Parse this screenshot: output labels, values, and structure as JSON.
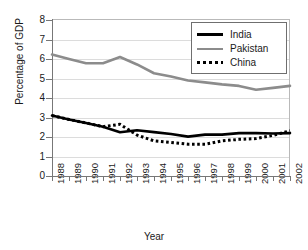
{
  "chart_data": {
    "type": "line",
    "title": "",
    "xlabel": "Year",
    "ylabel": "Percentage of GDP",
    "x": [
      1988,
      1989,
      1990,
      1991,
      1992,
      1993,
      1994,
      1995,
      1996,
      1997,
      1998,
      1999,
      2000,
      2001,
      2002
    ],
    "categories": [
      "1988",
      "1989",
      "1990",
      "1991",
      "1992",
      "1993",
      "1994",
      "1995",
      "1996",
      "1997",
      "1998",
      "1999",
      "2000",
      "2001",
      "2002"
    ],
    "xlim": [
      1988,
      2002
    ],
    "ylim": [
      0,
      8
    ],
    "yticks": [
      0,
      1,
      2,
      3,
      4,
      5,
      6,
      7,
      8
    ],
    "grid": true,
    "legend_position": "top-right",
    "series": [
      {
        "name": "India",
        "style": "solid",
        "color": "#000000",
        "width": 2.6,
        "values": [
          3.1,
          2.9,
          2.72,
          2.53,
          2.24,
          2.35,
          2.25,
          2.15,
          2.02,
          2.12,
          2.12,
          2.2,
          2.2,
          2.18,
          2.2
        ]
      },
      {
        "name": "Pakistan",
        "style": "solid",
        "color": "#8c8c8c",
        "width": 2.6,
        "values": [
          6.23,
          6.0,
          5.78,
          5.78,
          6.1,
          5.72,
          5.27,
          5.1,
          4.9,
          4.8,
          4.7,
          4.62,
          4.42,
          4.52,
          4.62
        ]
      },
      {
        "name": "China",
        "style": "dotted",
        "color": "#000000",
        "width": 3.0,
        "values": [
          3.1,
          2.9,
          2.72,
          2.53,
          2.65,
          2.1,
          1.8,
          1.72,
          1.63,
          1.63,
          1.8,
          1.88,
          1.92,
          2.08,
          2.32
        ]
      }
    ]
  },
  "axes": {
    "ylabel": "Percentage of GDP",
    "xlabel": "Year",
    "ytick_labels": [
      "8",
      "7",
      "6",
      "5",
      "4",
      "3",
      "2",
      "1",
      "0"
    ],
    "xtick_labels": [
      "1988",
      "1989",
      "1990",
      "1991",
      "1992",
      "1993",
      "1994",
      "1995",
      "1996",
      "1997",
      "1998",
      "1999",
      "2000",
      "2001",
      "2002"
    ]
  },
  "legend": {
    "items": [
      {
        "label": "India",
        "color": "#000000",
        "style": "solid"
      },
      {
        "label": "Pakistan",
        "color": "#8c8c8c",
        "style": "solid"
      },
      {
        "label": "China",
        "color": "#000000",
        "style": "dotted"
      }
    ]
  }
}
